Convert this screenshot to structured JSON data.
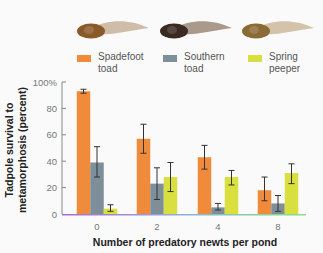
{
  "chart_data": {
    "type": "bar",
    "title": "",
    "xlabel": "Number of predatory newts per pond",
    "ylabel_lines": [
      "Tadpole survival to",
      "metamorphosis (percent)"
    ],
    "ylim": [
      0,
      100
    ],
    "yticks": [
      "0",
      "20",
      "40",
      "60",
      "80",
      "100%"
    ],
    "ytick_values": [
      0,
      20,
      40,
      60,
      80,
      100
    ],
    "categories": [
      "0",
      "2",
      "4",
      "8"
    ],
    "series": [
      {
        "name": "Spadefoot toad",
        "color": "#EF8B3B",
        "values": [
          93,
          57,
          43,
          18
        ],
        "error_low": [
          91.5,
          46,
          34,
          10
        ],
        "error_high": [
          94.5,
          68,
          52,
          28
        ]
      },
      {
        "name": "Southern toad",
        "color": "#7F8F99",
        "values": [
          39,
          23,
          5,
          8
        ],
        "error_low": [
          28,
          11,
          3,
          2
        ],
        "error_high": [
          51,
          35,
          8,
          14
        ]
      },
      {
        "name": "Spring peeper",
        "color": "#D8DF3F",
        "values": [
          4,
          28,
          28,
          31
        ],
        "error_low": [
          2,
          17,
          22,
          23
        ],
        "error_high": [
          7,
          39,
          33,
          38
        ]
      }
    ],
    "legend_position": "top",
    "grid": false
  },
  "legend": [
    {
      "label": "Spadefoot\ntoad",
      "color": "#EF8B3B"
    },
    {
      "label": "Southern\ntoad",
      "color": "#7F8F99"
    },
    {
      "label": "Spring\npeeper",
      "color": "#D8DF3F"
    }
  ],
  "illustrations": [
    {
      "name": "spadefoot-toad-tadpole",
      "body": "#8a5a2b",
      "tail": "#c8b29a"
    },
    {
      "name": "southern-toad-tadpole",
      "body": "#3a2a22",
      "tail": "#9a8878"
    },
    {
      "name": "spring-peeper-tadpole",
      "body": "#8a6a35",
      "tail": "#cbb89c"
    }
  ]
}
